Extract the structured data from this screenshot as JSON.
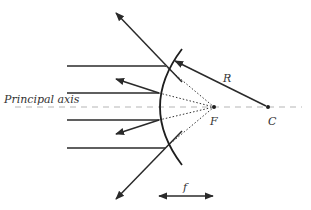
{
  "diagram": {
    "type": "convex-mirror-ray-diagram",
    "labels": {
      "principal_axis": "Principal axis",
      "focal_point": "F",
      "center_of_curvature": "C",
      "radius": "R",
      "focal_length": "f"
    },
    "colors": {
      "ray": "#2a2a2a",
      "mirror": "#1e1e1e",
      "axis": "#b5b5b5",
      "dotted": "#333333",
      "label": "#333333"
    },
    "incident_rays": [
      {
        "y": 66
      },
      {
        "y": 93
      },
      {
        "y": 120
      },
      {
        "y": 148
      }
    ],
    "points": {
      "F": {
        "x": 214,
        "y": 107
      },
      "C": {
        "x": 268,
        "y": 107
      }
    }
  }
}
